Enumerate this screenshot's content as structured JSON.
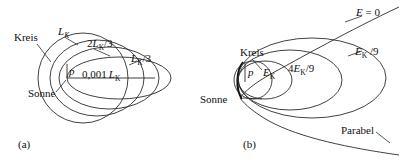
{
  "figure": {
    "caption_a": "(a)",
    "caption_b": "(b)",
    "panel_a": {
      "labels": {
        "kreis": "Kreis",
        "sonne": "Sonne",
        "focus_point": "p",
        "orbit_full": "L",
        "orbit_full_sub": "K",
        "orbit_two_thirds_pre": "2",
        "orbit_two_thirds_main": "L",
        "orbit_two_thirds_sub": "K",
        "orbit_two_thirds_post": "/3",
        "orbit_one_third_main": "L",
        "orbit_one_third_sub": "K",
        "orbit_one_third_post": "/3",
        "radius_value": "0,001",
        "radius_unit_main": "L",
        "radius_unit_sub": "K"
      }
    },
    "panel_b": {
      "labels": {
        "kreis": "Kreis",
        "sonne": "Sonne",
        "focus_point": "p",
        "parabel": "Parabel",
        "energy_zero_main": "E",
        "energy_zero_post": " = 0",
        "energy_k_main": "E",
        "energy_k_sub": "K",
        "energy_4_9_pre": "4",
        "energy_4_9_main": "E",
        "energy_4_9_sub": "K",
        "energy_4_9_post": "/9",
        "energy_1_9_main": "E",
        "energy_1_9_sub": "K",
        "energy_1_9_post": " /9"
      }
    },
    "colors": {
      "stroke": "#2b2b2b",
      "background": "#ffffff",
      "text": "#111111"
    }
  }
}
